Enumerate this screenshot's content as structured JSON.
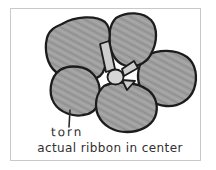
{
  "figure": {
    "annotations": {
      "torn_label": "torn",
      "caption": "actual ribbon in center"
    },
    "colors": {
      "background": "#ffffff",
      "frame_border": "#c9c9c9",
      "petal_fill": "#9e9e9e",
      "petal_shade_dark": "#8d8d8d",
      "petal_shade_light": "#ababab",
      "outline": "#1c1c1c",
      "tab_fill": "#cdcdcd",
      "center_knot_fill": "#d6d6d6",
      "text": "#2f2f2f"
    },
    "shapes": {
      "petal_count": 5
    }
  }
}
